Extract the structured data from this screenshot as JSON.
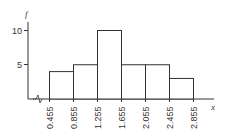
{
  "chart_data": {
    "type": "bar",
    "subtype": "histogram",
    "title": "",
    "xlabel": "x",
    "ylabel": "f",
    "bin_edges": [
      0.455,
      0.855,
      1.255,
      1.655,
      2.055,
      2.455,
      2.855
    ],
    "categories": [
      "0.455–0.855",
      "0.855–1.255",
      "1.255–1.655",
      "1.655–2.055",
      "2.055–2.455",
      "2.455–2.855"
    ],
    "values": [
      4,
      5,
      10,
      5,
      5,
      3
    ],
    "y_ticks": [
      5,
      10
    ],
    "x_tick_labels": [
      "0.455",
      "0.855",
      "1.255",
      "1.655",
      "2.055",
      "2.455",
      "2.855"
    ],
    "ylim": [
      0,
      11
    ],
    "axis_break": true,
    "grid": false,
    "legend": null
  },
  "labels": {
    "y_axis": "f",
    "x_axis": "x",
    "y_tick_5": "5",
    "y_tick_10": "10"
  }
}
